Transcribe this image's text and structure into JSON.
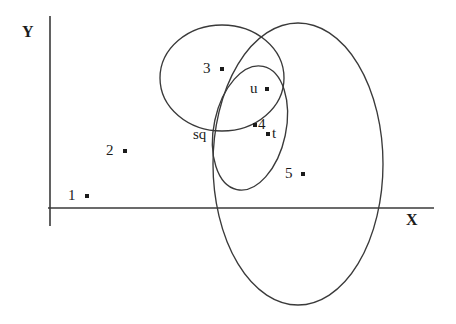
{
  "figure": {
    "kind": "venn-scatter-diagram",
    "background_color": "#ffffff",
    "stroke_color": "#3a3a3a",
    "text_color": "#1b1b1b",
    "width": 456,
    "height": 324
  },
  "axes": {
    "x_label": "X",
    "y_label": "Y",
    "x_label_pos": {
      "x": 406,
      "y": 212
    },
    "y_label_pos": {
      "x": 22,
      "y": 24
    },
    "x_axis": {
      "x1": 48,
      "y1": 208,
      "x2": 434,
      "y2": 208
    },
    "y_axis": {
      "x1": 50,
      "y1": 16,
      "x2": 50,
      "y2": 226
    }
  },
  "points": [
    {
      "id": "p1",
      "label": "1",
      "label_x": 68,
      "label_y": 188,
      "dot_x": 87,
      "dot_y": 196,
      "label_side": "left"
    },
    {
      "id": "p2",
      "label": "2",
      "label_x": 106,
      "label_y": 143,
      "dot_x": 125,
      "dot_y": 151,
      "label_side": "left"
    },
    {
      "id": "p3",
      "label": "3",
      "label_x": 203,
      "label_y": 61,
      "dot_x": 222,
      "dot_y": 69,
      "label_side": "left"
    },
    {
      "id": "pu",
      "label": "u",
      "label_x": 250,
      "label_y": 81,
      "dot_x": 267,
      "dot_y": 89,
      "label_side": "left"
    },
    {
      "id": "p4",
      "label": "4",
      "label_x": 261,
      "label_y": 117,
      "dot_x": 255,
      "dot_y": 125,
      "label_side": "right"
    },
    {
      "id": "pt",
      "label": "t",
      "label_x": 274,
      "label_y": 126,
      "dot_x": 268,
      "dot_y": 134,
      "label_side": "right"
    },
    {
      "id": "p5",
      "label": "5",
      "label_x": 285,
      "label_y": 166,
      "dot_x": 303,
      "dot_y": 174,
      "label_side": "left"
    }
  ],
  "text_labels": [
    {
      "id": "sq",
      "label": "sq",
      "x": 193,
      "y": 127
    }
  ],
  "ellipses": [
    {
      "id": "ellipse-left",
      "cx": 222,
      "cy": 78,
      "rx": 62,
      "ry": 53,
      "rotation": 0
    },
    {
      "id": "ellipse-right-large",
      "cx": 298,
      "cy": 164,
      "rx": 85,
      "ry": 141,
      "rotation": 0
    },
    {
      "id": "ellipse-small-tilt",
      "cx": 250,
      "cy": 128,
      "rx": 36,
      "ry": 63,
      "rotation": 12
    }
  ],
  "dot_size": 4
}
